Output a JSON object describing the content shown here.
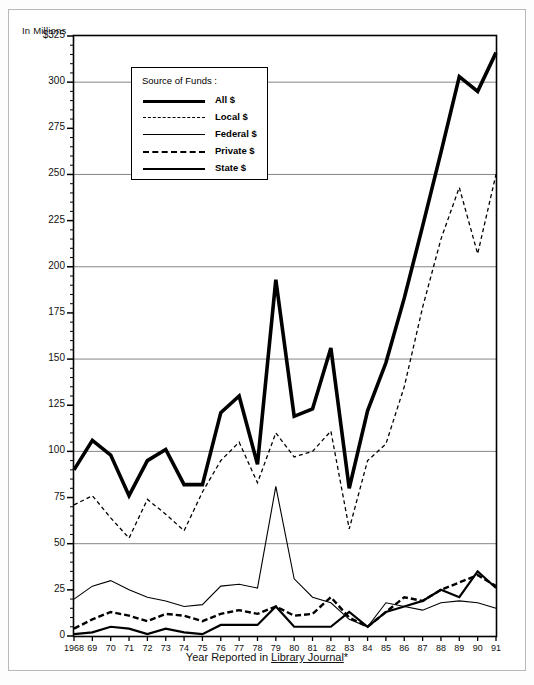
{
  "unit_label": "In Millions",
  "legend": {
    "title": "Source of Funds :",
    "entries": [
      {
        "label": "All $",
        "style": "thick-solid",
        "key": "all"
      },
      {
        "label": "Local $",
        "style": "thin-dashed",
        "key": "local"
      },
      {
        "label": "Federal $",
        "style": "thin-solid",
        "key": "federal"
      },
      {
        "label": "Private $",
        "style": "medium-dashed",
        "key": "private"
      },
      {
        "label": "State $",
        "style": "medium-solid",
        "key": "state"
      }
    ]
  },
  "axis_title_x_prefix": "Year Reported in ",
  "axis_title_x_underlined": "Library Journal",
  "axis_title_x_suffix": "*",
  "colors": {
    "line": "#000000",
    "gridline": "#777777",
    "frame": "#000000",
    "outer_frame": "#b9b9b9",
    "background": "#ffffff"
  },
  "chart_data": {
    "type": "line",
    "title": "",
    "subtitle": "",
    "xlabel": "Year Reported in Library Journal*",
    "ylabel": "In Millions",
    "ylim": [
      0,
      325
    ],
    "xlim": [
      1968,
      1991
    ],
    "grid": true,
    "grid_axis": "y",
    "legend_position": "inside-top-left",
    "y_major_ticks": [
      0,
      50,
      100,
      150,
      200,
      250,
      300,
      325
    ],
    "y_tick_labels": [
      "0",
      "25",
      "50",
      "75",
      "100",
      "125",
      "150",
      "175",
      "200",
      "225",
      "250",
      "275",
      "300",
      "$325"
    ],
    "y_tick_values": [
      0,
      25,
      50,
      75,
      100,
      125,
      150,
      175,
      200,
      225,
      250,
      275,
      300,
      325
    ],
    "y_minor_tick_step": 5,
    "x": [
      1968,
      1969,
      1970,
      1971,
      1972,
      1973,
      1974,
      1975,
      1976,
      1977,
      1978,
      1979,
      1980,
      1981,
      1982,
      1983,
      1984,
      1985,
      1986,
      1987,
      1988,
      1989,
      1990,
      1991
    ],
    "categories": [
      "1968",
      "69",
      "70",
      "71",
      "72",
      "73",
      "74",
      "75",
      "76",
      "77",
      "78",
      "79",
      "80",
      "81",
      "82",
      "83",
      "84",
      "85",
      "86",
      "87",
      "88",
      "89",
      "90",
      "91"
    ],
    "series": [
      {
        "name": "All $",
        "key": "all",
        "style": "thick-solid",
        "width": 3.6,
        "dash": "",
        "values": [
          90,
          106,
          98,
          76,
          95,
          101,
          82,
          82,
          121,
          130,
          93,
          193,
          119,
          123,
          156,
          80,
          122,
          148,
          183,
          222,
          262,
          303,
          295,
          316
        ]
      },
      {
        "name": "Local $",
        "key": "local",
        "style": "thin-dashed",
        "width": 1.3,
        "dash": "4,3",
        "values": [
          71,
          76,
          64,
          53,
          74,
          66,
          57,
          78,
          95,
          105,
          83,
          110,
          97,
          100,
          111,
          58,
          95,
          104,
          135,
          178,
          215,
          243,
          207,
          250
        ]
      },
      {
        "name": "Federal $",
        "key": "federal",
        "style": "thin-solid",
        "width": 1.1,
        "dash": "",
        "values": [
          20,
          27,
          30,
          25,
          21,
          19,
          16,
          17,
          27,
          28,
          26,
          81,
          31,
          21,
          18,
          9,
          5,
          18,
          16,
          14,
          18,
          19,
          18,
          15
        ]
      },
      {
        "name": "Private $",
        "key": "private",
        "style": "medium-dashed",
        "width": 2.4,
        "dash": "6,3",
        "values": [
          4,
          9,
          13,
          11,
          8,
          12,
          11,
          8,
          12,
          14,
          12,
          16,
          11,
          12,
          21,
          10,
          5,
          13,
          21,
          19,
          25,
          29,
          33,
          27
        ]
      },
      {
        "name": "State $",
        "key": "state",
        "style": "medium-solid",
        "width": 2.2,
        "dash": "",
        "values": [
          1,
          2,
          5,
          4,
          1,
          4,
          2,
          1,
          6,
          6,
          6,
          16,
          5,
          5,
          5,
          13,
          5,
          13,
          16,
          19,
          25,
          21,
          35,
          26
        ]
      }
    ]
  }
}
